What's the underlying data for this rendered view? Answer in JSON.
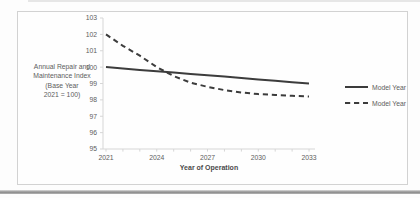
{
  "chart_data": {
    "type": "line",
    "title": "",
    "x": [
      2021,
      2022,
      2023,
      2024,
      2025,
      2026,
      2027,
      2028,
      2029,
      2030,
      2031,
      2032,
      2033
    ],
    "series": [
      {
        "name": "Model Year 2019",
        "style": "solid",
        "values": [
          100.0,
          99.92,
          99.83,
          99.75,
          99.67,
          99.58,
          99.5,
          99.42,
          99.33,
          99.25,
          99.17,
          99.08,
          99.0
        ]
      },
      {
        "name": "Model Year 2021",
        "style": "dashed",
        "values": [
          102.0,
          101.3,
          100.7,
          100.0,
          99.45,
          99.05,
          98.8,
          98.6,
          98.45,
          98.35,
          98.3,
          98.25,
          98.2
        ]
      }
    ],
    "xlabel": "Year of Operation",
    "ylabel_lines": [
      "Annual Repair and",
      "Maintenance Index",
      "(Base Year",
      "2021 = 100)"
    ],
    "ylim": [
      95,
      103
    ],
    "y_ticks": [
      103,
      102,
      101,
      100,
      99,
      98,
      97,
      96,
      95
    ],
    "x_tick_labels": [
      2021,
      2024,
      2027,
      2030,
      2033
    ],
    "grid": false,
    "legend_position": "right",
    "colors": {
      "series_line": "#3c3c3c",
      "axis_line": "#d6d6d6",
      "tick_text": "#5d5d5d",
      "axis_title_text": "#4a4a4a",
      "frame_border": "#d2d2d2",
      "page_rule": "#8a8a8a"
    }
  }
}
